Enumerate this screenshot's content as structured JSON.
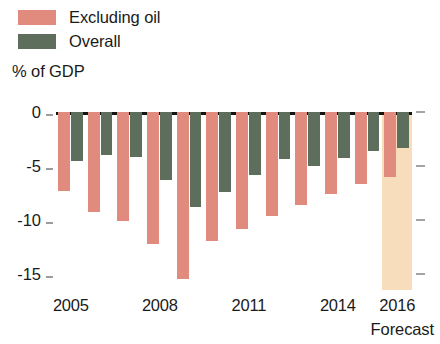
{
  "legend": {
    "items": [
      {
        "label": "Excluding oil",
        "color": "#e08b7e",
        "icon": "legend-swatch"
      },
      {
        "label": "Overall",
        "color": "#5e6e5c",
        "icon": "legend-swatch"
      }
    ]
  },
  "axis_title": "% of GDP",
  "forecast_note": "Forecast",
  "chart_data": {
    "type": "bar",
    "title": "",
    "subtitle": "",
    "xlabel": "",
    "ylabel": "% of GDP",
    "ylim": [
      -16.5,
      0
    ],
    "yticks": [
      0,
      -5,
      -10,
      -15
    ],
    "ytick_labels": [
      "0",
      "-5",
      "-10",
      "-15"
    ],
    "grid": false,
    "legend_position": "top-left",
    "categories": [
      "2005",
      "2006",
      "2007",
      "2008",
      "2009",
      "2010",
      "2011",
      "2012",
      "2013",
      "2014",
      "2015",
      "2016"
    ],
    "xtick_labels": [
      "2005",
      "2008",
      "2011",
      "2014",
      "2016"
    ],
    "forecast_categories": [
      "2016"
    ],
    "annotations": [
      "Forecast"
    ],
    "series": [
      {
        "name": "Excluding oil",
        "color": "#e08b7e",
        "values": [
          -7.3,
          -9.3,
          -10.1,
          -12.2,
          -15.5,
          -12.0,
          -10.8,
          -9.6,
          -8.6,
          -7.6,
          -6.7,
          -6.0
        ]
      },
      {
        "name": "Overall",
        "color": "#5e6e5c",
        "values": [
          -4.5,
          -4.0,
          -4.2,
          -6.3,
          -8.8,
          -7.4,
          -5.8,
          -4.4,
          -5.0,
          -4.3,
          -3.6,
          -3.3
        ]
      }
    ]
  }
}
